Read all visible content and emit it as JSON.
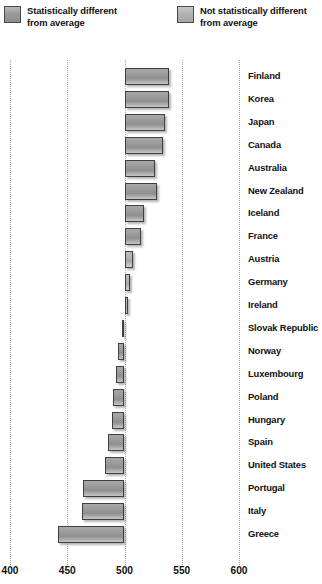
{
  "legend": {
    "items": [
      {
        "key": "sig",
        "label": "Statistically different\nfrom average",
        "swatch_color": "#9a9a9a"
      },
      {
        "key": "notsig",
        "label": "Not statistically different\nfrom average",
        "swatch_color": "#b2b2b2"
      }
    ]
  },
  "axis": {
    "ticks": [
      "400",
      "450",
      "500",
      "550",
      "600"
    ],
    "min": 400,
    "max": 600,
    "baseline": 500
  },
  "chart_data": {
    "type": "bar",
    "orientation": "horizontal",
    "title": "",
    "subtitle": "",
    "xlabel": "",
    "ylabel": "",
    "xlim": [
      400,
      600
    ],
    "baseline": 500,
    "grid": true,
    "gridlines": [
      400,
      450,
      500,
      550,
      600
    ],
    "legend_position": "top",
    "categories": [
      "Finland",
      "Korea",
      "Japan",
      "Canada",
      "Australia",
      "New Zealand",
      "Iceland",
      "France",
      "Austria",
      "Germany",
      "Ireland",
      "Slovak Republic",
      "Norway",
      "Luxembourg",
      "Poland",
      "Hungary",
      "Spain",
      "United States",
      "Portugal",
      "Italy",
      "Greece"
    ],
    "values": [
      539,
      539,
      535,
      534,
      527,
      528,
      517,
      514,
      507,
      505,
      503,
      498,
      494,
      493,
      490,
      489,
      486,
      483,
      464,
      463,
      442
    ],
    "significance": [
      "sig",
      "sig",
      "sig",
      "sig",
      "sig",
      "sig",
      "sig",
      "sig",
      "notsig",
      "notsig",
      "notsig",
      "notsig",
      "sig",
      "sig",
      "sig",
      "sig",
      "sig",
      "sig",
      "sig",
      "sig",
      "sig"
    ],
    "colors": {
      "sig": "#9a9a9a",
      "notsig": "#b4b4b4",
      "gridline": "#b4a9a0"
    }
  }
}
